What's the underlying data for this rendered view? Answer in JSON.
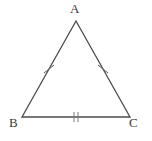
{
  "figure": {
    "kind": "isosceles-triangle",
    "background_color": "#ffffff",
    "stroke_color": "#4a4a4a",
    "label_color": "#3a3a3a",
    "stroke_width": 1.3,
    "tick_stroke_width": 1.0,
    "width": 152,
    "height": 141
  },
  "vertices": [
    {
      "id": "A",
      "label": "A",
      "x": 76,
      "y": 21,
      "role": "apex"
    },
    {
      "id": "B",
      "label": "B",
      "x": 22,
      "y": 117,
      "role": "base-left"
    },
    {
      "id": "C",
      "label": "C",
      "x": 130,
      "y": 117,
      "role": "base-right"
    }
  ],
  "sides": [
    {
      "id": "AB",
      "from": "A",
      "to": "B",
      "tick_count": 1,
      "tick_style": "slash",
      "midpoint": {
        "x": 49,
        "y": 69
      }
    },
    {
      "id": "AC",
      "from": "A",
      "to": "C",
      "tick_count": 1,
      "tick_style": "slash",
      "midpoint": {
        "x": 103,
        "y": 69
      }
    },
    {
      "id": "BC",
      "from": "B",
      "to": "C",
      "tick_count": 2,
      "tick_style": "vertical",
      "midpoint": {
        "x": 76,
        "y": 117
      }
    }
  ],
  "geometry": {
    "polygon_points": "76,21 22,117 130,117"
  },
  "tick_marks": {
    "AB": {
      "lines": [
        {
          "x1": 44,
          "y1": 73,
          "x2": 54,
          "y2": 65
        }
      ]
    },
    "AC": {
      "lines": [
        {
          "x1": 98,
          "y1": 65,
          "x2": 108,
          "y2": 73
        }
      ]
    },
    "BC": {
      "lines": [
        {
          "x1": 74,
          "y1": 112,
          "x2": 74,
          "y2": 122
        },
        {
          "x1": 78,
          "y1": 112,
          "x2": 78,
          "y2": 122
        }
      ]
    }
  }
}
